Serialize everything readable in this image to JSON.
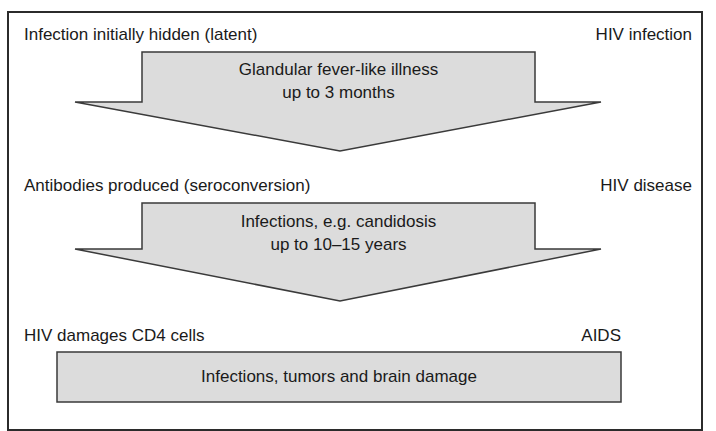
{
  "diagram": {
    "colors": {
      "border": "#2b2b2b",
      "shape_fill": "#dcdcdc",
      "shape_stroke": "#3a3a3a",
      "text": "#1a1a1a"
    },
    "stages": [
      {
        "left_label": "Infection initially hidden (latent)",
        "right_label": "HIV infection",
        "shape": "down-arrow",
        "text_line1": "Glandular fever-like illness",
        "text_line2": "up to 3 months"
      },
      {
        "left_label": "Antibodies produced (seroconversion)",
        "right_label": "HIV disease",
        "shape": "down-arrow",
        "text_line1": "Infections, e.g. candidosis",
        "text_line2": "up to 10–15 years"
      },
      {
        "left_label": "HIV damages CD4 cells",
        "right_label": "AIDS",
        "shape": "box",
        "text_line1": "Infections, tumors and brain damage"
      }
    ]
  }
}
